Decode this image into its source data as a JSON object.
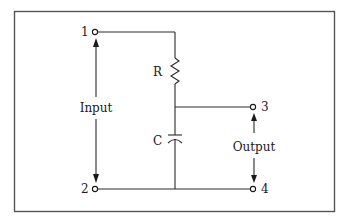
{
  "diagram": {
    "type": "RC low-pass filter circuit",
    "colors": {
      "line": "#2a2a2a",
      "frame": "#555555",
      "text": "#1a1a1a",
      "background": "#ffffff"
    },
    "terminals": [
      {
        "id": "1",
        "label": "1"
      },
      {
        "id": "2",
        "label": "2"
      },
      {
        "id": "3",
        "label": "3"
      },
      {
        "id": "4",
        "label": "4"
      }
    ],
    "components": {
      "resistor": {
        "label": "R"
      },
      "capacitor": {
        "label": "C"
      }
    },
    "ports": {
      "input": {
        "label": "Input",
        "between": [
          "1",
          "2"
        ]
      },
      "output": {
        "label": "Output",
        "between": [
          "3",
          "4"
        ]
      }
    }
  }
}
